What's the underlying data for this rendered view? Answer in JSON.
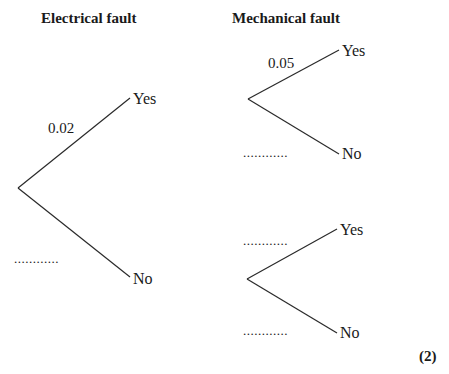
{
  "headings": {
    "electrical": "Electrical fault",
    "mechanical": "Mechanical fault"
  },
  "tree": {
    "first_stage": {
      "yes_label": "Yes",
      "no_label": "No",
      "yes_prob": "0.02",
      "no_prob": "............"
    },
    "second_stage_upper": {
      "yes_label": "Yes",
      "no_label": "No",
      "yes_prob": "0.05",
      "no_prob": "............"
    },
    "second_stage_lower": {
      "yes_label": "Yes",
      "no_label": "No",
      "yes_prob": "............",
      "no_prob": "............"
    }
  },
  "marks": "(2)",
  "colors": {
    "line": "#2a2a2a",
    "text": "#1a1a1a",
    "background": "#ffffff"
  }
}
